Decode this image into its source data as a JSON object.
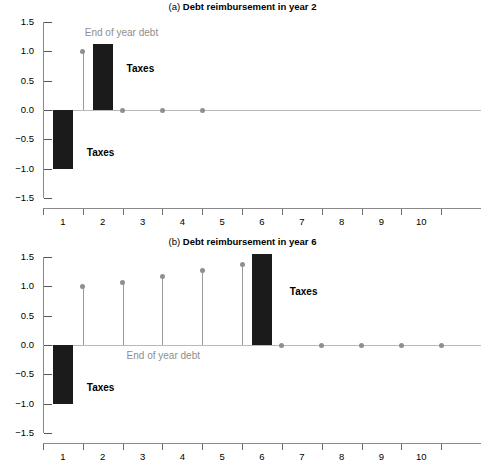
{
  "figure": {
    "width": 485,
    "height": 469,
    "background": "#ffffff"
  },
  "colors": {
    "bar": "#1b1b1b",
    "stem": "#9a9a9a",
    "marker": "#8f8f8f",
    "axis": "#8a8a8a",
    "zero_line": "#b9b9b9",
    "annotation_taxes": "#000000",
    "annotation_debt": "#8e8e8e"
  },
  "chart_data": [
    {
      "type": "bar",
      "panel": "a",
      "title_index": "(a)",
      "title": "Debt reimbursement in year 2",
      "xlabel": "",
      "ylabel": "",
      "ylim": [
        -1.5,
        1.5
      ],
      "xlim": [
        0.5,
        11.5
      ],
      "grid": false,
      "legend": "none",
      "yticks": [
        1.5,
        1.0,
        0.5,
        0.0,
        -0.5,
        -1.0,
        -1.5
      ],
      "ytick_labels": [
        "1.5",
        "1.0",
        "0.5",
        "0.0",
        "-0.5",
        "-1.0",
        "-1.5"
      ],
      "xticks": [
        1,
        2,
        3,
        4,
        5,
        6,
        7,
        8,
        9,
        10
      ],
      "xtick_labels": [
        "1",
        "2",
        "3",
        "4",
        "5",
        "6",
        "7",
        "8",
        "9",
        "10"
      ],
      "categories": [
        1,
        2,
        3,
        4,
        5,
        6,
        7,
        8,
        9,
        10
      ],
      "series": [
        {
          "name": "Taxes",
          "kind": "bar",
          "x": [
            1,
            2,
            3,
            4,
            5,
            6,
            7,
            8,
            9,
            10
          ],
          "values": [
            -1.0,
            1.12,
            0.0,
            0.0,
            0.0,
            0.0,
            0.0,
            0.0,
            0.0,
            0.0
          ]
        },
        {
          "name": "End of year debt",
          "kind": "stem",
          "x": [
            1.5,
            2.5,
            3.5,
            4.5
          ],
          "values": [
            1.0,
            0.0,
            0.0,
            0.0
          ]
        }
      ],
      "annotations": [
        {
          "text": "End of year debt",
          "style": "debt",
          "x": 1.55,
          "y": 1.33
        },
        {
          "text": "Taxes",
          "style": "taxes",
          "x": 2.6,
          "y": 0.72
        },
        {
          "text": "Taxes",
          "style": "taxes",
          "x": 1.6,
          "y": -0.72
        }
      ]
    },
    {
      "type": "bar",
      "panel": "b",
      "title_index": "(b)",
      "title": "Debt reimbursement in year 6",
      "xlabel": "",
      "ylabel": "",
      "ylim": [
        -1.5,
        1.5
      ],
      "xlim": [
        0.5,
        11.5
      ],
      "grid": false,
      "legend": "none",
      "yticks": [
        1.5,
        1.0,
        0.5,
        0.0,
        -0.5,
        -1.0,
        -1.5
      ],
      "ytick_labels": [
        "1.5",
        "1.0",
        "0.5",
        "0.0",
        "-0.5",
        "-1.0",
        "-1.5"
      ],
      "xticks": [
        1,
        2,
        3,
        4,
        5,
        6,
        7,
        8,
        9,
        10
      ],
      "xtick_labels": [
        "1",
        "2",
        "3",
        "4",
        "5",
        "6",
        "7",
        "8",
        "9",
        "10"
      ],
      "categories": [
        1,
        2,
        3,
        4,
        5,
        6,
        7,
        8,
        9,
        10
      ],
      "series": [
        {
          "name": "Taxes",
          "kind": "bar",
          "x": [
            1,
            2,
            3,
            4,
            5,
            6,
            7,
            8,
            9,
            10
          ],
          "values": [
            -1.0,
            0.0,
            0.0,
            0.0,
            0.0,
            1.55,
            0.0,
            0.0,
            0.0,
            0.0
          ]
        },
        {
          "name": "End of year debt",
          "kind": "stem",
          "x": [
            1.5,
            2.5,
            3.5,
            4.5,
            5.5,
            6.5,
            7.5,
            8.5,
            9.5,
            10.5
          ],
          "values": [
            1.0,
            1.07,
            1.17,
            1.27,
            1.37,
            0.0,
            0.0,
            0.0,
            0.0,
            0.0
          ]
        }
      ],
      "annotations": [
        {
          "text": "End of year debt",
          "style": "debt",
          "x": 2.6,
          "y": -0.17
        },
        {
          "text": "Taxes",
          "style": "taxes",
          "x": 6.7,
          "y": 0.92
        },
        {
          "text": "Taxes",
          "style": "taxes",
          "x": 1.6,
          "y": -0.72
        }
      ]
    }
  ]
}
